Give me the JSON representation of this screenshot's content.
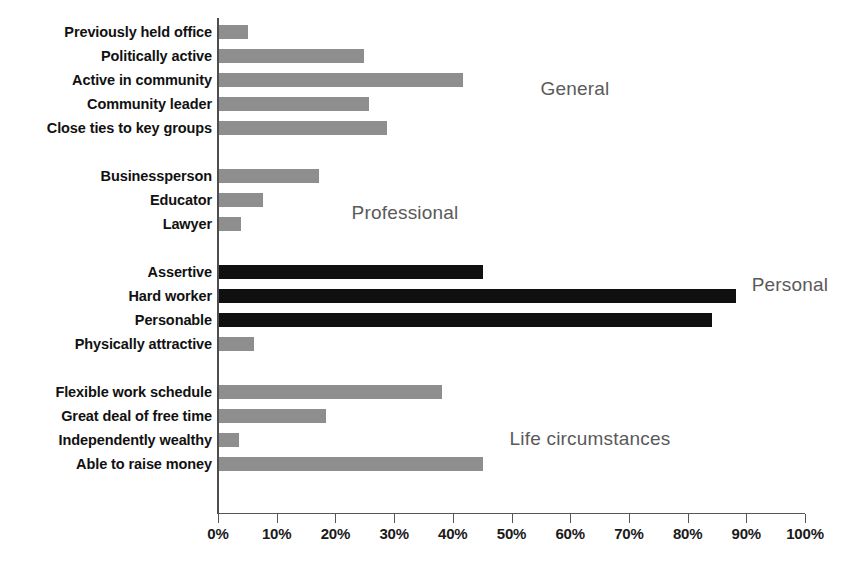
{
  "chart_data": {
    "type": "bar",
    "orientation": "horizontal",
    "title": "",
    "xlabel": "",
    "ylabel": "",
    "xlim": [
      0,
      100
    ],
    "grid": false,
    "legend": "none",
    "axis": {
      "ticks": [
        0,
        10,
        20,
        30,
        40,
        50,
        60,
        70,
        80,
        90,
        100
      ],
      "tick_labels": [
        "0%",
        "10%",
        "20%",
        "30%",
        "40%",
        "50%",
        "60%",
        "70%",
        "80%",
        "90%",
        "100%"
      ]
    },
    "colors": {
      "gray_bar": "#8e8e8e",
      "black_bar": "#101010",
      "group_label": "#5a5a5a",
      "axis": "#4d4d4d",
      "background": "#ffffff"
    },
    "groups": [
      {
        "name": "General",
        "label": "General",
        "label_x": 575,
        "label_y": 78,
        "color": "gray",
        "items": [
          {
            "label": "Previously held office",
            "value": 5
          },
          {
            "label": "Politically active",
            "value": 24.7
          },
          {
            "label": "Active in community",
            "value": 41.6
          },
          {
            "label": "Community leader",
            "value": 25.5
          },
          {
            "label": "Close ties to key groups",
            "value": 28.6
          }
        ]
      },
      {
        "name": "Professional",
        "label": "Professional",
        "label_x": 405,
        "label_y": 202,
        "color": "gray",
        "items": [
          {
            "label": "Businessperson",
            "value": 17.0
          },
          {
            "label": "Educator",
            "value": 7.5
          },
          {
            "label": "Lawyer",
            "value": 3.7
          }
        ]
      },
      {
        "name": "Personal",
        "label": "Personal",
        "label_x": 790,
        "label_y": 274,
        "color": "black",
        "items": [
          {
            "label": "Assertive",
            "value": 45.0,
            "color": "black"
          },
          {
            "label": "Hard worker",
            "value": 88.0,
            "color": "black"
          },
          {
            "label": "Personable",
            "value": 84.0,
            "color": "black"
          },
          {
            "label": "Physically attractive",
            "value": 6.0,
            "color": "gray"
          }
        ]
      },
      {
        "name": "Life circumstances",
        "label": "Life circumstances",
        "label_x": 590,
        "label_y": 428,
        "color": "gray",
        "items": [
          {
            "label": "Flexible work schedule",
            "value": 38.0
          },
          {
            "label": "Great deal of free time",
            "value": 18.2
          },
          {
            "label": "Independently wealthy",
            "value": 3.4
          },
          {
            "label": "Able to raise money",
            "value": 45.0
          }
        ]
      }
    ]
  }
}
